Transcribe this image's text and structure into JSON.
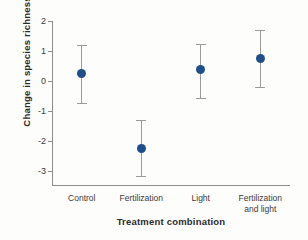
{
  "chart_data": {
    "type": "scatter",
    "title": "",
    "xlabel": "Treatment combination",
    "ylabel": "Change in species richness",
    "categories": [
      "Control",
      "Fertilization",
      "Light",
      "Fertilization and light"
    ],
    "values": [
      0.25,
      -2.25,
      0.37,
      0.75
    ],
    "error_low": [
      -0.72,
      -3.15,
      -0.55,
      -0.2
    ],
    "error_high": [
      1.2,
      -1.3,
      1.25,
      1.7
    ],
    "ylim": [
      -3.5,
      2
    ],
    "yticks": [
      2,
      1,
      0,
      -1,
      -2,
      -3
    ],
    "ytick_labels": [
      "2",
      "1",
      "0",
      "-1",
      "-2",
      "-3"
    ],
    "grid": false,
    "legend": "none",
    "marker_color": "#1f4f8b",
    "errorbar_color": "#9a9a9a",
    "axis_color": "#8d8d8d",
    "points": [
      {
        "category": "Control",
        "label_lines": [
          "Control"
        ],
        "value": 0.25,
        "low": -0.72,
        "high": 1.2
      },
      {
        "category": "Fertilization",
        "label_lines": [
          "Fertilization"
        ],
        "value": -2.25,
        "low": -3.15,
        "high": -1.3
      },
      {
        "category": "Light",
        "label_lines": [
          "Light"
        ],
        "value": 0.37,
        "low": -0.55,
        "high": 1.25
      },
      {
        "category": "Fertilization and light",
        "label_lines": [
          "Fertilization",
          "and light"
        ],
        "value": 0.75,
        "low": -0.2,
        "high": 1.7
      }
    ]
  }
}
